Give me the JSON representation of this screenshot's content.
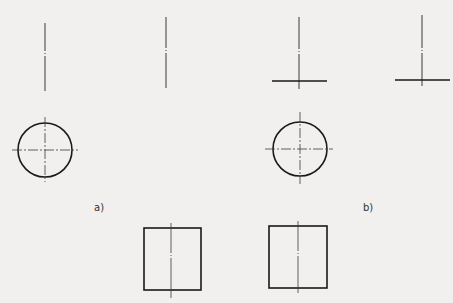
{
  "figure": {
    "background": "#f1f0ee",
    "stroke_color": "#1a1a1a",
    "thin_stroke_color": "#3a3a3a",
    "panels": [
      {
        "id": "a",
        "label": "a)",
        "elevation_views": [
          {
            "x": 45,
            "y1": 23,
            "y2": 91
          },
          {
            "x": 166,
            "y1": 17,
            "y2": 88
          }
        ],
        "plan_circle": {
          "cx": 45,
          "cy": 150,
          "r": 27
        },
        "section_rect": {
          "x": 144,
          "y": 228,
          "w": 57,
          "h": 62,
          "centerline_x": 171
        }
      },
      {
        "id": "b",
        "label": "b)",
        "elevation_views": [
          {
            "x": 299,
            "y1": 17,
            "y2": 89,
            "base": {
              "x1": 272,
              "x2": 327,
              "y": 81
            }
          },
          {
            "x": 422,
            "y1": 15,
            "y2": 86,
            "base": {
              "x1": 395,
              "x2": 450,
              "y": 80
            }
          }
        ],
        "plan_circle": {
          "cx": 300,
          "cy": 149,
          "r": 27
        },
        "section_rect": {
          "x": 269,
          "y": 226,
          "w": 58,
          "h": 62,
          "centerline_x": 298
        }
      }
    ]
  }
}
